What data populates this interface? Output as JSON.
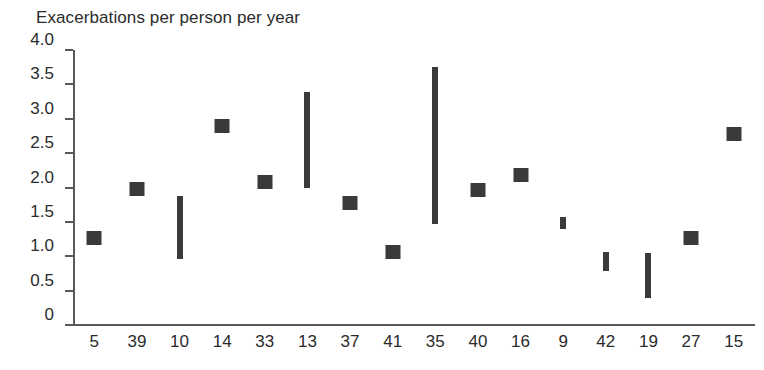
{
  "chart_data": {
    "type": "scatter",
    "title": "Exacerbations per person per year",
    "xlabel": "",
    "ylabel": "",
    "ylim": [
      0,
      4.0
    ],
    "ytick_labels": [
      "4.0",
      "3.5",
      "3.0",
      "2.5",
      "2.0",
      "1.5",
      "1.0",
      "0.5",
      "0"
    ],
    "ytick_values": [
      4.0,
      3.5,
      3.0,
      2.5,
      2.0,
      1.5,
      1.0,
      0.5,
      0
    ],
    "grid": false,
    "legend": null,
    "marker_color": "#3a3a3a",
    "axis_color": "#5a5a5a",
    "categories": [
      "5",
      "39",
      "10",
      "14",
      "33",
      "13",
      "37",
      "41",
      "35",
      "40",
      "16",
      "9",
      "42",
      "19",
      "27",
      "15"
    ],
    "points": [
      {
        "category": "5",
        "shape": "square",
        "value": 1.27
      },
      {
        "category": "39",
        "shape": "square",
        "value": 1.98
      },
      {
        "category": "10",
        "shape": "bar",
        "low": 0.96,
        "high": 1.87
      },
      {
        "category": "14",
        "shape": "square",
        "value": 2.89
      },
      {
        "category": "33",
        "shape": "square",
        "value": 2.08
      },
      {
        "category": "13",
        "shape": "bar",
        "low": 2.0,
        "high": 3.39
      },
      {
        "category": "37",
        "shape": "square",
        "value": 1.78
      },
      {
        "category": "41",
        "shape": "square",
        "value": 1.06
      },
      {
        "category": "35",
        "shape": "bar",
        "low": 1.47,
        "high": 3.76
      },
      {
        "category": "40",
        "shape": "square",
        "value": 1.97
      },
      {
        "category": "16",
        "shape": "square",
        "value": 2.18
      },
      {
        "category": "9",
        "shape": "bar",
        "low": 1.4,
        "high": 1.57
      },
      {
        "category": "42",
        "shape": "bar",
        "low": 0.79,
        "high": 1.06
      },
      {
        "category": "19",
        "shape": "bar",
        "low": 0.39,
        "high": 1.05
      },
      {
        "category": "27",
        "shape": "square",
        "value": 1.26
      },
      {
        "category": "15",
        "shape": "square",
        "value": 2.78
      }
    ]
  }
}
